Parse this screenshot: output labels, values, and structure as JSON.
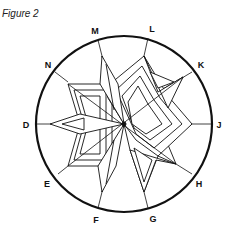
{
  "figure": {
    "title": "Figure 2",
    "labels": [
      {
        "id": "M",
        "text": "M",
        "x": 95,
        "y": 31
      },
      {
        "id": "L",
        "text": "L",
        "x": 152,
        "y": 29
      },
      {
        "id": "K",
        "text": "K",
        "x": 201,
        "y": 65
      },
      {
        "id": "J",
        "text": "J",
        "x": 219,
        "y": 125
      },
      {
        "id": "H",
        "text": "H",
        "x": 199,
        "y": 184
      },
      {
        "id": "G",
        "text": "G",
        "x": 153,
        "y": 219
      },
      {
        "id": "F",
        "text": "F",
        "x": 96,
        "y": 220
      },
      {
        "id": "E",
        "text": "E",
        "x": 47,
        "y": 184
      },
      {
        "id": "D",
        "text": "D",
        "x": 26,
        "y": 125
      },
      {
        "id": "N",
        "text": "N",
        "x": 48,
        "y": 65
      }
    ]
  }
}
